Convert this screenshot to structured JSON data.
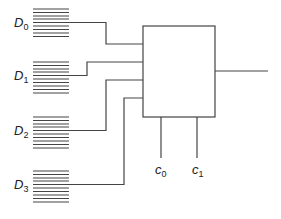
{
  "diagram": {
    "type": "multiplexer-4to1",
    "inputs": [
      {
        "label": "D",
        "sub": "0"
      },
      {
        "label": "D",
        "sub": "1"
      },
      {
        "label": "D",
        "sub": "2"
      },
      {
        "label": "D",
        "sub": "3"
      }
    ],
    "selects": [
      {
        "label": "c",
        "sub": "0"
      },
      {
        "label": "c",
        "sub": "1"
      }
    ],
    "colors": {
      "line": "#444444",
      "background": "#ffffff"
    }
  }
}
